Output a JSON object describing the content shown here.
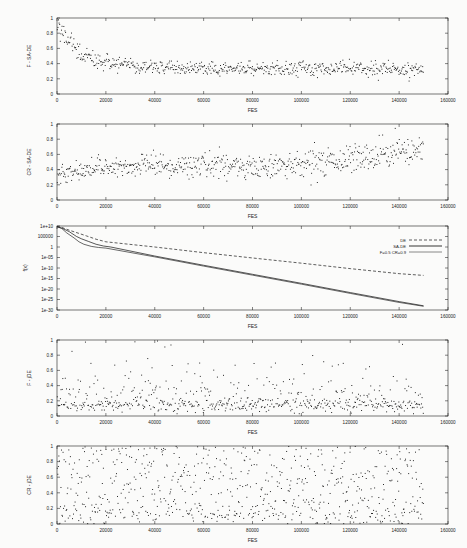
{
  "figure": {
    "background_color": "#fbfbfa",
    "axis_color": "#1d1d1d",
    "marker_color": "#111111",
    "width": 467,
    "height": 548,
    "panel_count": 5
  },
  "chart_data": [
    {
      "type": "scatter",
      "title": "",
      "xlabel": "FES",
      "ylabel": "F - SA-DE",
      "xlim": [
        0,
        160000
      ],
      "ylim": [
        0,
        1
      ],
      "xticks": [
        0,
        20000,
        40000,
        60000,
        80000,
        100000,
        120000,
        140000,
        160000
      ],
      "xticklabels": [
        "0",
        "20000",
        "40000",
        "60000",
        "80000",
        "100000",
        "120000",
        "140000",
        "160000"
      ],
      "yticks": [
        0,
        0.2,
        0.4,
        0.6,
        0.8,
        1
      ],
      "yticklabels": [
        "0",
        "0.2",
        "0.4",
        "0.6",
        "0.8",
        "1"
      ],
      "grid": false,
      "legend": null,
      "description": "Scale factor F of SA-DE versus function evaluations; starts near 0.85 and decays to a dense band around 0.3-0.4",
      "marker": "dot",
      "n_points": 620,
      "seed": 17,
      "model": "sade_f"
    },
    {
      "type": "scatter",
      "title": "",
      "xlabel": "FES",
      "ylabel": "CR - SA-DE",
      "xlim": [
        0,
        160000
      ],
      "ylim": [
        0,
        1
      ],
      "xticks": [
        0,
        20000,
        40000,
        60000,
        80000,
        100000,
        120000,
        140000,
        160000
      ],
      "xticklabels": [
        "0",
        "20000",
        "40000",
        "60000",
        "80000",
        "100000",
        "120000",
        "140000",
        "160000"
      ],
      "yticks": [
        0,
        0.2,
        0.4,
        0.6,
        0.8,
        1
      ],
      "yticklabels": [
        "0",
        "0.2",
        "0.4",
        "0.6",
        "0.8",
        "1"
      ],
      "grid": false,
      "legend": null,
      "description": "Crossover rate CR of SA-DE drifts upward from about 0.35 to about 0.6 with increasing spread",
      "marker": "dot",
      "n_points": 640,
      "seed": 41,
      "model": "sade_cr"
    },
    {
      "type": "line",
      "title": "",
      "xlabel": "FES",
      "ylabel": "f(x)",
      "xlim": [
        0,
        160000
      ],
      "ylim": [
        1e-30,
        10000000000.0
      ],
      "yscale": "log",
      "xticks": [
        0,
        20000,
        40000,
        60000,
        80000,
        100000,
        120000,
        140000,
        160000
      ],
      "xticklabels": [
        "0",
        "20000",
        "40000",
        "60000",
        "80000",
        "100000",
        "120000",
        "140000",
        "160000"
      ],
      "yticks": [
        10000000000.0,
        100000.0,
        1,
        1e-05,
        1e-10,
        1e-15,
        1e-20,
        1e-25,
        1e-30
      ],
      "yticklabels": [
        "1e+10",
        "100000",
        "1",
        "1e-05",
        "1e-10",
        "1e-15",
        "1e-20",
        "1e-25",
        "1e-30"
      ],
      "grid": false,
      "legend": {
        "position": "top-right",
        "entries": [
          {
            "label": "DE",
            "dash": "dashed"
          },
          {
            "label": "SA-DE",
            "dash": "solid"
          },
          {
            "label": "F=0.5 CR=0.9",
            "dash": "solid-thin"
          }
        ]
      },
      "description": "Convergence of best objective value on log scale; SA-DE and F=0.5 CR=0.9 reach about 1e-28 while DE stalls near 1e-13",
      "series": [
        {
          "name": "DE",
          "dash": "dashed",
          "x": [
            0,
            2000,
            5000,
            9000,
            12000,
            16000,
            20000,
            40000,
            60000,
            80000,
            100000,
            120000,
            140000,
            150000
          ],
          "y": [
            5000000000.0,
            2000000000.0,
            100000000.0,
            3000000.0,
            200000.0,
            5000.0,
            300.0,
            1.0,
            0.002,
            6e-06,
            2e-08,
            5e-11,
            2e-13,
            3e-14
          ]
        },
        {
          "name": "SA-DE",
          "dash": "solid",
          "x": [
            0,
            2000,
            5000,
            8000,
            10000,
            13000,
            16000,
            19000,
            22000,
            40000,
            60000,
            80000,
            100000,
            120000,
            140000,
            150000
          ],
          "y": [
            5000000000.0,
            1000000000.0,
            20000000.0,
            100000.0,
            8000.0,
            400.0,
            20.0,
            3.0,
            1.0,
            5e-05,
            2e-09,
            1e-13,
            5e-18,
            2e-22,
            1e-26,
            1e-28
          ]
        },
        {
          "name": "F=0.5 CR=0.9",
          "dash": "solid-thin",
          "x": [
            0,
            2000,
            4000,
            7000,
            9000,
            11000,
            14000,
            17000,
            20000,
            40000,
            60000,
            80000,
            100000,
            120000,
            140000,
            150000
          ],
          "y": [
            5000000000.0,
            600000000.0,
            5000000.0,
            20000.0,
            300.0,
            20.0,
            2.0,
            0.6,
            0.3,
            2e-05,
            8e-10,
            4e-14,
            2e-18,
            8e-23,
            4e-27,
            6e-29
          ]
        }
      ]
    },
    {
      "type": "scatter",
      "title": "",
      "xlabel": "FES",
      "ylabel": "F - jDE",
      "xlim": [
        0,
        160000
      ],
      "ylim": [
        0,
        1
      ],
      "xticks": [
        0,
        20000,
        40000,
        60000,
        80000,
        100000,
        120000,
        140000,
        160000
      ],
      "xticklabels": [
        "0",
        "20000",
        "40000",
        "60000",
        "80000",
        "100000",
        "120000",
        "140000",
        "160000"
      ],
      "yticks": [
        0,
        0.2,
        0.4,
        0.6,
        0.8,
        1
      ],
      "yticklabels": [
        "0",
        "0.2",
        "0.4",
        "0.6",
        "0.8",
        "1"
      ],
      "grid": false,
      "legend": null,
      "description": "Scale factor F of jDE concentrated in a low band near 0.1-0.25 with sparse outliers reaching 1.0",
      "marker": "dot",
      "n_points": 600,
      "seed": 73,
      "model": "jde_f"
    },
    {
      "type": "scatter",
      "title": "",
      "xlabel": "FES",
      "ylabel": "CR - jDE",
      "xlim": [
        0,
        160000
      ],
      "ylim": [
        0,
        1
      ],
      "xticks": [
        0,
        20000,
        40000,
        60000,
        80000,
        100000,
        120000,
        140000,
        160000
      ],
      "xticklabels": [
        "0",
        "20000",
        "40000",
        "60000",
        "80000",
        "100000",
        "120000",
        "140000",
        "160000"
      ],
      "yticks": [
        0,
        0.2,
        0.4,
        0.6,
        0.8,
        1
      ],
      "yticklabels": [
        "0",
        "0.2",
        "0.4",
        "0.6",
        "0.8",
        "1"
      ],
      "grid": false,
      "legend": null,
      "description": "Crossover rate CR of jDE scattered almost uniformly across the full 0 to 1 range",
      "marker": "dot",
      "n_points": 700,
      "seed": 109,
      "model": "jde_cr"
    }
  ]
}
